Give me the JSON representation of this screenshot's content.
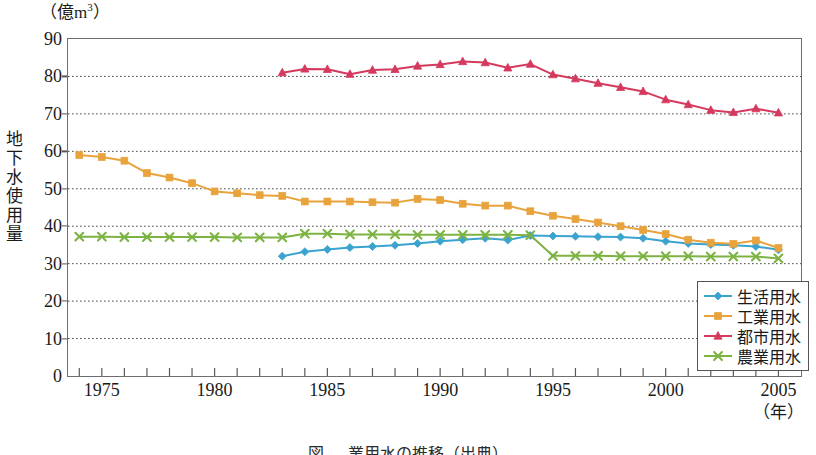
{
  "chart_data": {
    "type": "line",
    "title": "",
    "unit_caption": "（億m",
    "unit_exponent": "3",
    "unit_caption_close": "）",
    "ylabel": "地下水使用量",
    "ylabel_chars": [
      "地",
      "下",
      "水",
      "使",
      "用",
      "量"
    ],
    "xlabel": "（年）",
    "x": [
      1974,
      1975,
      1976,
      1977,
      1978,
      1979,
      1980,
      1981,
      1982,
      1983,
      1984,
      1985,
      1986,
      1987,
      1988,
      1989,
      1990,
      1991,
      1992,
      1993,
      1994,
      1995,
      1996,
      1997,
      1998,
      1999,
      2000,
      2001,
      2002,
      2003,
      2004,
      2005
    ],
    "xlim": [
      1973.5,
      2006.0
    ],
    "ylim": [
      0,
      90
    ],
    "yticks": [
      0,
      10,
      20,
      30,
      40,
      50,
      60,
      70,
      80,
      90
    ],
    "xticks": [
      1975,
      1980,
      1985,
      1990,
      1995,
      2000,
      2005
    ],
    "xtick_labels": [
      "1975",
      "1980",
      "1985",
      "1990",
      "1995",
      "2000",
      "2005"
    ],
    "grid": "horizontal-dotted",
    "legend_position": "bottom-right",
    "series": [
      {
        "name": "生活用水",
        "color": "#3ba3d0",
        "marker": "diamond",
        "x_start": 1983,
        "values": [
          null,
          null,
          null,
          null,
          null,
          null,
          null,
          null,
          null,
          32.0,
          33.2,
          33.8,
          34.3,
          34.6,
          34.9,
          35.4,
          36.0,
          36.4,
          36.8,
          36.3,
          37.5,
          37.4,
          37.3,
          37.2,
          37.1,
          36.8,
          36.0,
          35.4,
          35.1,
          34.9,
          34.6,
          33.7
        ]
      },
      {
        "name": "工業用水",
        "color": "#e8a33d",
        "marker": "square",
        "x_start": 1974,
        "values": [
          59.0,
          58.5,
          57.5,
          54.2,
          53.0,
          51.5,
          49.3,
          48.8,
          48.3,
          48.1,
          46.6,
          46.6,
          46.6,
          46.4,
          46.3,
          47.3,
          47.0,
          46.0,
          45.5,
          45.5,
          44.0,
          42.8,
          41.9,
          41.0,
          40.0,
          39.0,
          37.9,
          36.4,
          35.6,
          35.3,
          36.2,
          34.2
        ]
      },
      {
        "name": "都市用水",
        "color": "#d6395e",
        "marker": "triangle",
        "x_start": 1983,
        "values": [
          null,
          null,
          null,
          null,
          null,
          null,
          null,
          null,
          null,
          81.0,
          82.0,
          81.9,
          80.6,
          81.7,
          81.9,
          82.8,
          83.2,
          84.0,
          83.7,
          82.3,
          83.3,
          80.5,
          79.4,
          78.2,
          77.1,
          76.0,
          73.8,
          72.5,
          71.0,
          70.4,
          71.4,
          70.3
        ]
      },
      {
        "name": "農業用水",
        "color": "#7cb342",
        "marker": "x",
        "x_start": 1974,
        "values": [
          37.2,
          37.2,
          37.1,
          37.1,
          37.1,
          37.1,
          37.1,
          37.0,
          37.0,
          37.0,
          38.0,
          38.0,
          37.8,
          37.8,
          37.8,
          37.7,
          37.7,
          37.7,
          37.7,
          37.7,
          37.6,
          32.1,
          32.1,
          32.1,
          32.0,
          32.0,
          32.0,
          32.0,
          31.9,
          31.9,
          31.9,
          31.4
        ]
      }
    ]
  },
  "legend": {
    "items": [
      {
        "label": "生活用水",
        "color": "#3ba3d0",
        "marker": "diamond"
      },
      {
        "label": "工業用水",
        "color": "#e8a33d",
        "marker": "square"
      },
      {
        "label": "都市用水",
        "color": "#d6395e",
        "marker": "triangle"
      },
      {
        "label": "農業用水",
        "color": "#7cb342",
        "marker": "x"
      }
    ]
  },
  "caption": "図 ― 業用水の推移（出典）"
}
